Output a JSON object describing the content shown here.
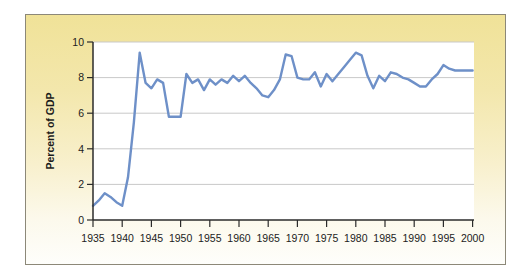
{
  "figure": {
    "page_background": "#ffffff",
    "card_border_color": "#8c8878",
    "card_gradient_top": "#f0e298",
    "card_gradient_bottom": "#fefefb"
  },
  "chart_data": {
    "type": "line",
    "title": "",
    "xlabel": "",
    "ylabel": "Percent of GDP",
    "xlim": [
      1935,
      2000
    ],
    "ylim": [
      0,
      10
    ],
    "x_ticks": [
      1935,
      1940,
      1945,
      1950,
      1955,
      1960,
      1965,
      1970,
      1975,
      1980,
      1985,
      1990,
      1995,
      2000
    ],
    "y_ticks": [
      0,
      2,
      4,
      6,
      8,
      10
    ],
    "grid": "horizontal gridlines at y ticks",
    "legend": "none",
    "plot_background": "#ffffff",
    "gridline_color": "#c9c9c9",
    "axis_color": "#2b2b2b",
    "line_color": "#6e90c8",
    "series": [
      {
        "name": "Percent of GDP",
        "x": [
          1935,
          1936,
          1937,
          1938,
          1939,
          1940,
          1941,
          1942,
          1943,
          1944,
          1945,
          1946,
          1947,
          1948,
          1949,
          1950,
          1951,
          1952,
          1953,
          1954,
          1955,
          1956,
          1957,
          1958,
          1959,
          1960,
          1961,
          1962,
          1963,
          1964,
          1965,
          1966,
          1967,
          1968,
          1969,
          1970,
          1971,
          1972,
          1973,
          1974,
          1975,
          1976,
          1977,
          1978,
          1979,
          1980,
          1981,
          1982,
          1983,
          1984,
          1985,
          1986,
          1987,
          1988,
          1989,
          1990,
          1991,
          1992,
          1993,
          1994,
          1995,
          1996,
          1997,
          1998,
          1999,
          2000
        ],
        "values": [
          0.8,
          1.1,
          1.5,
          1.3,
          1.0,
          0.8,
          2.4,
          5.5,
          9.4,
          7.7,
          7.4,
          7.9,
          7.7,
          5.8,
          5.8,
          5.8,
          8.2,
          7.7,
          7.9,
          7.3,
          7.9,
          7.6,
          7.9,
          7.7,
          8.1,
          7.8,
          8.1,
          7.7,
          7.4,
          7.0,
          6.9,
          7.3,
          7.9,
          9.3,
          9.2,
          8.0,
          7.9,
          7.9,
          8.3,
          7.5,
          8.2,
          7.8,
          8.2,
          8.6,
          9.0,
          9.4,
          9.25,
          8.1,
          7.4,
          8.1,
          7.8,
          8.3,
          8.2,
          8.0,
          7.9,
          7.7,
          7.5,
          7.5,
          7.9,
          8.2,
          8.7,
          8.5,
          8.4,
          8.4,
          8.4,
          8.4
        ]
      }
    ]
  }
}
